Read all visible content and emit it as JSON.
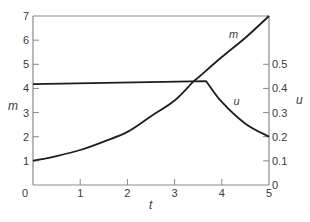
{
  "chart_data": {
    "type": "line",
    "title": "",
    "xlabel": "t",
    "ylabel": "m",
    "y2label": "u",
    "xlim": [
      0,
      5
    ],
    "ylim": [
      0,
      7
    ],
    "y2lim": [
      0,
      0.7
    ],
    "grid": false,
    "legend": "none (curves labeled inline)",
    "x_ticks": [
      0,
      1,
      2,
      3,
      4,
      5
    ],
    "y_ticks": [
      1,
      2,
      3,
      4,
      5,
      6,
      7
    ],
    "y2_ticks": [
      0,
      0.1,
      0.2,
      0.3,
      0.4,
      0.5
    ],
    "series": [
      {
        "name": "m",
        "axis": "left",
        "x": [
          0,
          0.5,
          1,
          1.5,
          2,
          2.5,
          3,
          3.39,
          3.5,
          4,
          4.5,
          5
        ],
        "values": [
          1.0,
          1.2,
          1.45,
          1.8,
          2.2,
          2.85,
          3.5,
          4.27,
          4.45,
          5.3,
          6.1,
          7.0
        ],
        "label": "m",
        "label_pos": [
          4.15,
          6.1
        ]
      },
      {
        "name": "u",
        "axis": "right",
        "x": [
          0,
          3.67,
          4,
          4.5,
          5
        ],
        "values": [
          0.418,
          0.43,
          0.344,
          0.254,
          0.2
        ],
        "label": "u",
        "label_pos": [
          4.25,
          0.33
        ]
      }
    ],
    "annotations": [
      "m",
      "u"
    ]
  },
  "labels": {
    "x_ticks": [
      "0",
      "1",
      "2",
      "3",
      "4",
      "5"
    ],
    "y_ticks": [
      "1",
      "2",
      "3",
      "4",
      "5",
      "6",
      "7"
    ],
    "y2_ticks": [
      "0",
      "0.1",
      "0.2",
      "0.3",
      "0.4",
      "0.5"
    ],
    "xlabel": "t",
    "ylabel": "m",
    "y2label": "u",
    "m_curve": "m",
    "u_curve": "u"
  },
  "colors": {
    "axis": "#8a8a8a",
    "curve": "#1e1e1e",
    "text": "#3a3a3a"
  }
}
